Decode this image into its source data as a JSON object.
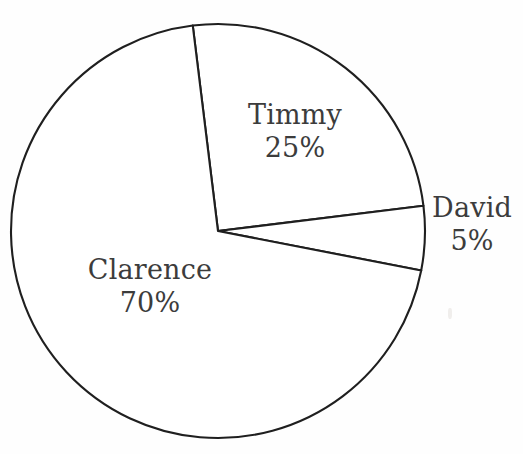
{
  "chart_data": {
    "type": "pie",
    "title": "",
    "subtitle": "",
    "xlabel": "",
    "ylabel": "",
    "legend_position": "none",
    "grid": false,
    "value_unit": "%",
    "total": 100,
    "categories": [
      "Timmy",
      "David",
      "Clarence"
    ],
    "values": [
      25,
      5,
      70
    ],
    "slices": [
      {
        "name": "Timmy",
        "value": 25,
        "value_label": "25%",
        "label_placement": "inside",
        "start_angle_deg": -97,
        "end_angle_deg": -7,
        "fill": "#ffffff",
        "stroke": "#1f1f1f"
      },
      {
        "name": "David",
        "value": 5,
        "value_label": "5%",
        "label_placement": "outside",
        "start_angle_deg": -7,
        "end_angle_deg": 11,
        "fill": "#ffffff",
        "stroke": "#1f1f1f"
      },
      {
        "name": "Clarence",
        "value": 70,
        "value_label": "70%",
        "label_placement": "inside",
        "start_angle_deg": 11,
        "end_angle_deg": 263,
        "fill": "#ffffff",
        "stroke": "#1f1f1f"
      }
    ],
    "geometry": {
      "center_x": 218,
      "center_y": 231,
      "radius": 207
    },
    "colors": {
      "background": "#fefefe",
      "outline": "#1f1f1f",
      "text": "#3c3c3c"
    }
  },
  "labels": {
    "timmy": {
      "name": "Timmy",
      "value": "25%"
    },
    "david": {
      "name": "David",
      "value": "5%"
    },
    "clarence": {
      "name": "Clarence",
      "value": "70%"
    }
  }
}
